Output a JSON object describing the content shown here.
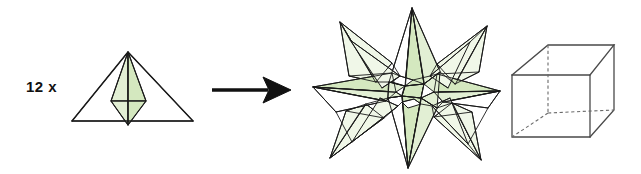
{
  "figure": {
    "background_color": "#ffffff",
    "width": 641,
    "height": 174
  },
  "colors": {
    "face_fill_light": "#e2efd4",
    "face_fill_mid": "#d4e8bf",
    "face_fill_pale": "#f0f7e8",
    "stroke": "#1a1a1a",
    "cube_stroke": "#4a4a4a",
    "text": "#111111"
  },
  "unit": {
    "label": "12 x",
    "count": 12,
    "multiplier_symbol": "x",
    "shape_name": "triangular-module",
    "description": "Equilateral triangle with an inscribed green kite-shaped folded module"
  },
  "arrow": {
    "name": "right-arrow",
    "direction": "right",
    "from_x": 212,
    "to_x": 288,
    "y": 90
  },
  "result": {
    "shape_name": "stellated-polyhedron",
    "description": "Assembled stellated polyhedron built from 12 modular units"
  },
  "reference": {
    "shape_name": "cube",
    "description": "Wireframe cube with dashed hidden edges shown for scale reference",
    "hidden_edge_style": "dashed"
  }
}
